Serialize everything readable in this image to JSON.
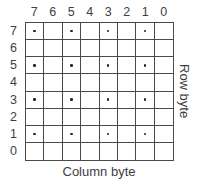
{
  "figure": {
    "column_axis_label": "Column byte",
    "row_axis_label": "Row byte",
    "column_labels": [
      "7",
      "6",
      "5",
      "4",
      "3",
      "2",
      "1",
      "0"
    ],
    "row_labels": [
      "7",
      "6",
      "5",
      "4",
      "3",
      "2",
      "1",
      "0"
    ],
    "grid": {
      "rows": 8,
      "columns": 8,
      "dot_rows": [
        7,
        5,
        3,
        1
      ],
      "dot_columns": [
        7,
        5,
        3,
        1
      ]
    },
    "colors": {
      "line": "#4a4a4a",
      "text": "#3e3e3e",
      "dot": "#222222",
      "background": "#ffffff"
    }
  }
}
